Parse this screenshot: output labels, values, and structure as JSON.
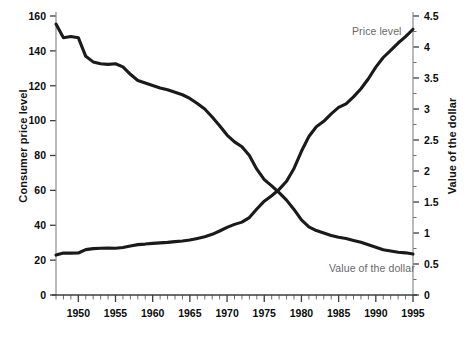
{
  "chart_data": {
    "type": "line",
    "title": "",
    "xlabel": "",
    "ylabel": "Consumer price level",
    "ylabel_right": "Value of the dollar",
    "grid": false,
    "legend_position": "inline-annotation",
    "xlim": [
      1947,
      1995
    ],
    "ylim": [
      0,
      160
    ],
    "ylim_right": [
      0,
      4.5
    ],
    "xticks": [
      1950,
      1955,
      1960,
      1965,
      1970,
      1975,
      1980,
      1985,
      1990,
      1995
    ],
    "xtick_labels": [
      "1950",
      "1955",
      "1960",
      "1965",
      "1970",
      "1975",
      "1980",
      "1985",
      "1990",
      "1995"
    ],
    "x_minor_tick_interval": 1,
    "yticks": [
      0,
      20,
      40,
      60,
      80,
      100,
      120,
      140,
      160
    ],
    "ytick_labels": [
      "0",
      "20",
      "40",
      "60",
      "80",
      "100",
      "120",
      "140",
      "160"
    ],
    "yticks_right": [
      0,
      0.5,
      1,
      1.5,
      2,
      2.5,
      3,
      3.5,
      4,
      4.5
    ],
    "ytick_labels_right": [
      "0",
      "0.5",
      "1",
      "1.5",
      "2",
      "2.5",
      "3",
      "3.5",
      "4",
      "4.5"
    ],
    "y_minor_tick_interval_right": 0.25,
    "x": [
      1947,
      1948,
      1949,
      1950,
      1951,
      1952,
      1953,
      1954,
      1955,
      1956,
      1957,
      1958,
      1959,
      1960,
      1961,
      1962,
      1963,
      1964,
      1965,
      1966,
      1967,
      1968,
      1969,
      1970,
      1971,
      1972,
      1973,
      1974,
      1975,
      1976,
      1977,
      1978,
      1979,
      1980,
      1981,
      1982,
      1983,
      1984,
      1985,
      1986,
      1987,
      1988,
      1989,
      1990,
      1991,
      1992,
      1993,
      1994,
      1995
    ],
    "series": [
      {
        "name": "Price level",
        "axis": "left",
        "color": "#1a1a1a",
        "label_text": "Price level",
        "values": [
          22.9,
          24.1,
          24.0,
          24.1,
          26.0,
          26.6,
          26.8,
          26.9,
          26.8,
          27.2,
          28.1,
          28.9,
          29.2,
          29.6,
          29.9,
          30.2,
          30.6,
          31.0,
          31.5,
          32.4,
          33.4,
          34.8,
          36.7,
          38.8,
          40.5,
          41.8,
          44.4,
          49.3,
          53.8,
          56.9,
          60.6,
          65.2,
          72.6,
          82.4,
          90.9,
          96.5,
          99.6,
          103.9,
          107.6,
          109.6,
          113.6,
          118.3,
          124.0,
          130.7,
          136.2,
          140.3,
          144.5,
          148.2,
          152.4
        ]
      },
      {
        "name": "Value of the dollar",
        "axis": "right",
        "color": "#1a1a1a",
        "label_text": "Value of the dollar",
        "values": [
          4.37,
          4.15,
          4.17,
          4.15,
          3.85,
          3.76,
          3.73,
          3.72,
          3.73,
          3.68,
          3.56,
          3.46,
          3.42,
          3.38,
          3.34,
          3.31,
          3.27,
          3.23,
          3.17,
          3.09,
          3.0,
          2.87,
          2.73,
          2.58,
          2.47,
          2.39,
          2.25,
          2.03,
          1.86,
          1.76,
          1.65,
          1.53,
          1.38,
          1.21,
          1.1,
          1.04,
          1.0,
          0.96,
          0.93,
          0.91,
          0.88,
          0.85,
          0.81,
          0.77,
          0.73,
          0.71,
          0.69,
          0.68,
          0.66
        ]
      }
    ]
  },
  "labels": {
    "price_level": "Price level",
    "dollar_value": "Value of the dollar",
    "y_left_title": "Consumer price level",
    "y_right_title": "Value of the dollar"
  }
}
